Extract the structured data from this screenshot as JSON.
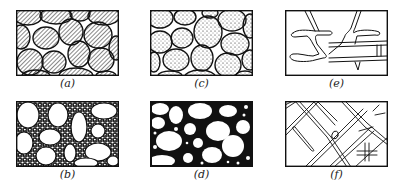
{
  "figure": {
    "panels": [
      {
        "id": "a",
        "label": "(a)",
        "description": "grains with hatched fill, touching, small voids"
      },
      {
        "id": "b",
        "label": "(b)",
        "description": "large white grains in matrix of small particles"
      },
      {
        "id": "c",
        "label": "(c)",
        "description": "grains with stippled fill, touching, small voids"
      },
      {
        "id": "d",
        "label": "(d)",
        "description": "white grains in solid black matrix"
      },
      {
        "id": "e",
        "label": "(e)",
        "description": "sparse branching cemented bonds"
      },
      {
        "id": "f",
        "label": "(f)",
        "description": "dense diagonal network of bonds"
      }
    ]
  },
  "colors": {
    "ink": "#111111",
    "paper": "#ffffff"
  }
}
